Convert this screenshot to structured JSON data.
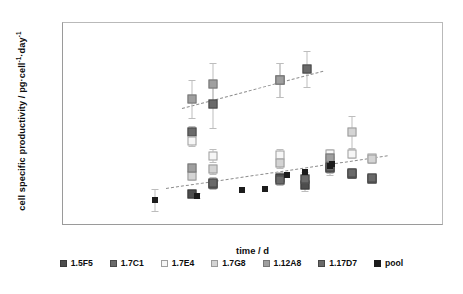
{
  "chart_data": {
    "type": "scatter",
    "title": "",
    "xlabel": "time / d",
    "ylabel": "cell specific productivity / pg·cell⁻¹·day⁻¹",
    "xlim": [
      0,
      17
    ],
    "ylim": [
      0,
      18
    ],
    "xticks": [
      "0",
      "1",
      "2",
      "3",
      "4",
      "5",
      "6",
      "7",
      "8",
      "9",
      "10",
      "11",
      "12",
      "13",
      "14",
      "15",
      "16",
      "17"
    ],
    "yticks": [
      "0",
      "2",
      "4",
      "6",
      "8",
      "10",
      "12",
      "14",
      "16",
      "18"
    ],
    "grid": false,
    "legend_position": "bottom",
    "series": [
      {
        "name": "1.5F5",
        "color": "#4d4d4d",
        "fill": "#4d4d4d",
        "border": "#3a3a3a",
        "points": [
          {
            "x": 5.75,
            "y": 2.85,
            "err": 0.25
          },
          {
            "x": 6.7,
            "y": 3.75,
            "err": 0.45
          },
          {
            "x": 9.7,
            "y": 4.3,
            "err": 0.5
          },
          {
            "x": 10.8,
            "y": 3.6,
            "err": 0.5
          },
          {
            "x": 11.9,
            "y": 5.1,
            "err": 0.6
          },
          {
            "x": 12.9,
            "y": 4.6,
            "err": 0.35
          },
          {
            "x": 13.8,
            "y": 4.2,
            "err": 0.3
          }
        ]
      },
      {
        "name": "1.7C1",
        "color": "#5f5f5f",
        "fill": "#6a6a6a",
        "border": "#4a4a4a",
        "points": [
          {
            "x": 5.75,
            "y": 8.35,
            "err": 0.55
          },
          {
            "x": 6.7,
            "y": 10.8,
            "err": 2.1
          },
          {
            "x": 9.7,
            "y": 12.95,
            "err": 1.5
          },
          {
            "x": 10.9,
            "y": 13.9,
            "err": 1.6
          }
        ]
      },
      {
        "name": "1.7E4",
        "color": "#f2f2f2",
        "fill": "#f6f6f6",
        "border": "#9e9e9e",
        "points": [
          {
            "x": 5.75,
            "y": 7.5,
            "err": 0.45
          },
          {
            "x": 6.7,
            "y": 6.25,
            "err": 0.6
          },
          {
            "x": 9.7,
            "y": 6.3,
            "err": 0.5
          },
          {
            "x": 11.9,
            "y": 6.35,
            "err": 0.45
          },
          {
            "x": 12.9,
            "y": 6.4,
            "err": 0.4
          },
          {
            "x": 13.8,
            "y": 6.0,
            "err": 0.4
          }
        ]
      },
      {
        "name": "1.7G8",
        "color": "#cfcfcf",
        "fill": "#d4d4d4",
        "border": "#9a9a9a",
        "points": [
          {
            "x": 5.75,
            "y": 4.45,
            "err": 0.35
          },
          {
            "x": 6.7,
            "y": 5.05,
            "err": 0.4
          },
          {
            "x": 9.7,
            "y": 5.6,
            "err": 0.45
          },
          {
            "x": 11.9,
            "y": 5.75,
            "err": 0.5
          },
          {
            "x": 12.9,
            "y": 8.35,
            "err": 1.4
          },
          {
            "x": 13.8,
            "y": 5.95,
            "err": 0.4
          }
        ]
      },
      {
        "name": "1.12A8",
        "color": "#9a9a9a",
        "fill": "#9f9f9f",
        "border": "#777777",
        "points": [
          {
            "x": 5.75,
            "y": 5.1,
            "err": 0.4
          },
          {
            "x": 5.75,
            "y": 11.25,
            "err": 1.7
          },
          {
            "x": 6.7,
            "y": 12.55,
            "err": 1.9
          },
          {
            "x": 9.7,
            "y": 12.95,
            "err": 1.5
          },
          {
            "x": 11.9,
            "y": 6.0,
            "err": 0.5
          }
        ]
      },
      {
        "name": "1.17D7",
        "color": "#616161",
        "fill": "#696969",
        "border": "#464646",
        "points": [
          {
            "x": 6.7,
            "y": 3.85,
            "err": 0.5
          },
          {
            "x": 9.7,
            "y": 4.05,
            "err": 0.45
          },
          {
            "x": 10.8,
            "y": 4.2,
            "err": 0.55
          },
          {
            "x": 11.9,
            "y": 5.2,
            "err": 0.5
          },
          {
            "x": 12.9,
            "y": 4.7,
            "err": 0.4
          },
          {
            "x": 13.8,
            "y": 4.3,
            "err": 0.35
          }
        ]
      },
      {
        "name": "pool",
        "color": "#1c1c1c",
        "fill": "#1c1c1c",
        "border": "#1c1c1c",
        "points": [
          {
            "x": 4.1,
            "y": 2.3,
            "err": 1.0
          },
          {
            "x": 6.0,
            "y": 2.7,
            "err": 0.2
          },
          {
            "x": 8.0,
            "y": 3.15,
            "err": 0.0
          },
          {
            "x": 9.0,
            "y": 3.3,
            "err": 0.0
          },
          {
            "x": 10.0,
            "y": 4.5,
            "err": 0.0
          },
          {
            "x": 10.8,
            "y": 4.8,
            "err": 0.0
          },
          {
            "x": 11.9,
            "y": 5.35,
            "err": 0.0
          },
          {
            "x": 12.0,
            "y": 5.5,
            "err": 0.0
          }
        ]
      }
    ],
    "trendlines": [
      {
        "name": "upper-trendline",
        "x0": 5.3,
        "y0": 10.45,
        "x1": 11.6,
        "y1": 13.75
      },
      {
        "name": "lower-trendline",
        "x0": 4.6,
        "y0": 3.35,
        "x1": 14.5,
        "y1": 6.25
      }
    ]
  }
}
